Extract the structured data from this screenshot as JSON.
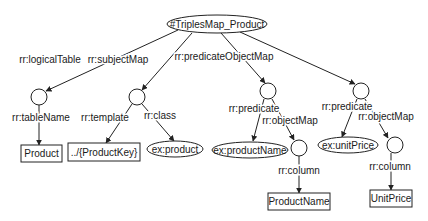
{
  "diagram": {
    "title": "#TriplesMap_Product",
    "nodes": [
      {
        "id": "root",
        "type": "ellipse",
        "label": "#TriplesMap_Product",
        "cx": 217,
        "cy": 24,
        "rx": 50,
        "ry": 9
      },
      {
        "id": "lt",
        "type": "circle",
        "label": "",
        "cx": 39,
        "cy": 97,
        "r": 8
      },
      {
        "id": "sm",
        "type": "circle",
        "label": "",
        "cx": 137,
        "cy": 97,
        "r": 8
      },
      {
        "id": "pom1",
        "type": "circle",
        "label": "",
        "cx": 268,
        "cy": 91,
        "r": 8
      },
      {
        "id": "pom2",
        "type": "circle",
        "label": "",
        "cx": 361,
        "cy": 91,
        "r": 8
      },
      {
        "id": "tblProduct",
        "type": "rect",
        "label": "Product",
        "x": 21,
        "y": 145,
        "w": 41,
        "h": 17
      },
      {
        "id": "tmpl",
        "type": "rect",
        "label": "../{ProductKey}",
        "x": 68,
        "y": 143,
        "w": 72,
        "h": 18
      },
      {
        "id": "exproduct",
        "type": "ellipse",
        "label": "ex:product",
        "cx": 175,
        "cy": 149,
        "rx": 28,
        "ry": 8
      },
      {
        "id": "exproductName",
        "type": "ellipse",
        "label": "ex:productName",
        "cx": 250,
        "cy": 150,
        "rx": 38,
        "ry": 8
      },
      {
        "id": "om1",
        "type": "circle",
        "label": "",
        "cx": 299,
        "cy": 148,
        "r": 8
      },
      {
        "id": "exunitPrice",
        "type": "ellipse",
        "label": "ex:unitPrice",
        "cx": 348,
        "cy": 145,
        "rx": 30,
        "ry": 8
      },
      {
        "id": "om2",
        "type": "circle",
        "label": "",
        "cx": 395,
        "cy": 145,
        "r": 8
      },
      {
        "id": "colProductName",
        "type": "rect",
        "label": "ProductName",
        "x": 268,
        "y": 193,
        "w": 62,
        "h": 17
      },
      {
        "id": "colUnitPrice",
        "type": "rect",
        "label": "UnitPrice",
        "x": 370,
        "y": 190,
        "w": 42,
        "h": 17
      }
    ],
    "edges": [
      {
        "from": "root",
        "to": "lt",
        "label": "rr:logicalTable",
        "x1": 178,
        "y1": 30,
        "x2": 46,
        "y2": 91,
        "lx": 50,
        "ly": 63
      },
      {
        "from": "root",
        "to": "sm",
        "label": "rr:subjectMap",
        "x1": 192,
        "y1": 33,
        "x2": 142,
        "y2": 90,
        "lx": 118,
        "ly": 63
      },
      {
        "from": "root",
        "to": "pom1",
        "label": "rr:predicateObjectMap",
        "x1": 221,
        "y1": 33,
        "x2": 265,
        "y2": 83,
        "lx": 224,
        "ly": 60
      },
      {
        "from": "root",
        "to": "pom2",
        "label": "",
        "x1": 240,
        "y1": 32,
        "x2": 355,
        "y2": 84,
        "lx": 0,
        "ly": 0
      },
      {
        "from": "lt",
        "to": "tblProduct",
        "label": "rr:tableName",
        "x1": 39,
        "y1": 105,
        "x2": 39,
        "y2": 145,
        "lx": 41,
        "ly": 121
      },
      {
        "from": "sm",
        "to": "tmpl",
        "label": "rr:template",
        "x1": 132,
        "y1": 104,
        "x2": 106,
        "y2": 143,
        "lx": 105,
        "ly": 121
      },
      {
        "from": "sm",
        "to": "exproduct",
        "label": "rr:class",
        "x1": 142,
        "y1": 104,
        "x2": 174,
        "y2": 141,
        "lx": 160,
        "ly": 119
      },
      {
        "from": "pom1",
        "to": "exproductName",
        "label": "rr:predicate",
        "x1": 264,
        "y1": 99,
        "x2": 253,
        "y2": 141,
        "lx": 254,
        "ly": 112
      },
      {
        "from": "pom1",
        "to": "om1",
        "label": "rr:objectMap",
        "x1": 272,
        "y1": 99,
        "x2": 294,
        "y2": 140,
        "lx": 290,
        "ly": 124
      },
      {
        "from": "pom2",
        "to": "exunitPrice",
        "label": "rr:predicate",
        "x1": 357,
        "y1": 99,
        "x2": 342,
        "y2": 137,
        "lx": 347,
        "ly": 110
      },
      {
        "from": "pom2",
        "to": "om2",
        "label": "rr:objectMap",
        "x1": 365,
        "y1": 99,
        "x2": 388,
        "y2": 138,
        "lx": 386,
        "ly": 120
      },
      {
        "from": "om1",
        "to": "colProductName",
        "label": "rr:column",
        "x1": 299,
        "y1": 156,
        "x2": 299,
        "y2": 193,
        "lx": 299,
        "ly": 174
      },
      {
        "from": "om2",
        "to": "colUnitPrice",
        "label": "rr:column",
        "x1": 391,
        "y1": 153,
        "x2": 391,
        "y2": 190,
        "lx": 390,
        "ly": 170
      }
    ]
  }
}
